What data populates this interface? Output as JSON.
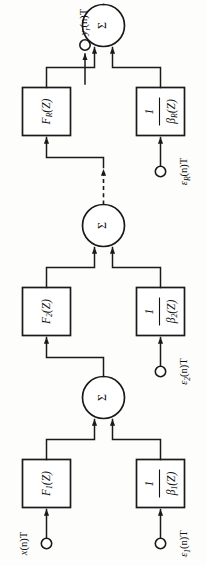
{
  "figure": {
    "orientation": "rotated-90",
    "ink_color": "#1a1a1a",
    "background_color": "#fdfdfc"
  },
  "output": {
    "label_main": "y",
    "label_sub": "r",
    "label_tail": "(n)T",
    "terminal": "open-circle"
  },
  "sum_symbol": "Σ",
  "stages": [
    {
      "id": "stage-1",
      "forward_block": {
        "main": "F",
        "sub": "1",
        "tail": "(Z)"
      },
      "feedback_block": {
        "numerator": "1",
        "denom_main": "β",
        "denom_sub": "1",
        "denom_tail": "(Z)"
      },
      "forward_input": {
        "main": "x",
        "sub": "",
        "tail": "(n)T",
        "terminal": "open-circle"
      },
      "feedback_input": {
        "main": "ε",
        "sub": "1",
        "tail": "(n)T",
        "terminal": "open-circle"
      }
    },
    {
      "id": "stage-2",
      "forward_block": {
        "main": "F",
        "sub": "2",
        "tail": "(Z)"
      },
      "feedback_block": {
        "numerator": "1",
        "denom_main": "β",
        "denom_sub": "2",
        "denom_tail": "(Z)"
      },
      "forward_input": null,
      "feedback_input": {
        "main": "ε",
        "sub": "2",
        "tail": "(n)T",
        "terminal": "open-circle"
      }
    },
    {
      "id": "stage-R",
      "forward_block": {
        "main": "F",
        "sub": "R",
        "tail": "(Z)"
      },
      "feedback_block": {
        "numerator": "1",
        "denom_main": "β",
        "denom_sub": "R",
        "denom_tail": "(Z)"
      },
      "forward_input": null,
      "feedback_input": {
        "main": "ε",
        "sub": "R",
        "tail": "(n)T",
        "terminal": "open-circle"
      }
    }
  ],
  "continuation": {
    "style": "dashed-arrow",
    "meaning": "stages 3 through R-1 omitted"
  }
}
